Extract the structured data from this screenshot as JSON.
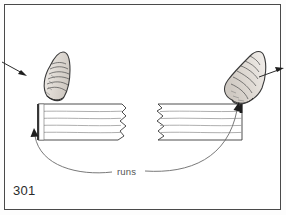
{
  "figure": {
    "page_number": "301",
    "caption_label": "runs",
    "kind": "technical-line-illustration",
    "colors": {
      "page_background": "#fdfdfd",
      "panel_background": "#ffffff",
      "frame_border": "#4a4a4a",
      "ink_dark": "#2b2b2b",
      "ink_medium": "#555555",
      "ink_light": "#9a9a9a",
      "board_line": "#8f8f8f",
      "board_fill": "#ffffff",
      "thumb_outline": "#3a3a3a",
      "thumb_shade": "#cfcac4",
      "joint_block": "#1e1e1e"
    },
    "elements": [
      {
        "name": "left-thumb",
        "label": "left thumb"
      },
      {
        "name": "right-thumb",
        "label": "right thumb"
      },
      {
        "name": "left-siding-board",
        "label": "left lap siding board"
      },
      {
        "name": "right-siding-board",
        "label": "right lap siding board"
      },
      {
        "name": "left-direction-arrow",
        "label": "arrow pointing in toward left thumb"
      },
      {
        "name": "right-direction-arrow",
        "label": "arrow pointing out from right thumb"
      },
      {
        "name": "left-runs-leader",
        "label": "curved leader to left board end"
      },
      {
        "name": "right-runs-leader",
        "label": "curved leader to right board end"
      }
    ]
  }
}
